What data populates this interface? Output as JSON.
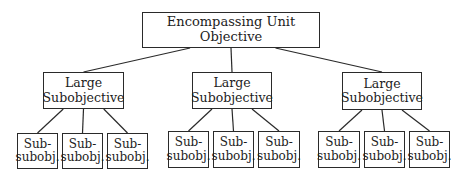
{
  "diagram": {
    "type": "hierarchy-tree",
    "root": {
      "label": "Encompassing Unit Objective",
      "box": [
        142,
        12,
        178,
        36
      ]
    },
    "large_subobjectives": [
      {
        "label": "Large\nSubobjective",
        "box": [
          43,
          72,
          81,
          37
        ],
        "children": [
          {
            "label": "Sub-\nsubobj.",
            "box": [
              17,
              133,
              41,
              36
            ]
          },
          {
            "label": "Sub-\nsubobj.",
            "box": [
              62,
              133,
              41,
              36
            ]
          },
          {
            "label": "Sub-\nsubobj.",
            "box": [
              107,
              133,
              41,
              36
            ]
          }
        ]
      },
      {
        "label": "Large\nSubobjective",
        "box": [
          192,
          72,
          80,
          37
        ],
        "children": [
          {
            "label": "Sub-\nsubobj.",
            "box": [
              168,
              131,
              41,
              37
            ]
          },
          {
            "label": "Sub-\nsubobj.",
            "box": [
              213,
              131,
              41,
              37
            ]
          },
          {
            "label": "Sub-\nsubobj.",
            "box": [
              258,
              131,
              42,
              37
            ]
          }
        ]
      },
      {
        "label": "Large\nSubobjective",
        "box": [
          342,
          72,
          80,
          38
        ],
        "children": [
          {
            "label": "Sub-\nsubobj.",
            "box": [
              318,
              131,
              42,
              37
            ]
          },
          {
            "label": "Sub-\nsubobj.",
            "box": [
              364,
              131,
              41,
              37
            ]
          },
          {
            "label": "Sub-\nsubobj.",
            "box": [
              409,
              131,
              41,
              37
            ]
          }
        ]
      }
    ],
    "colors": {
      "line": "#2a2a2a",
      "text": "#1c1c1c",
      "background": "#ffffff"
    }
  }
}
